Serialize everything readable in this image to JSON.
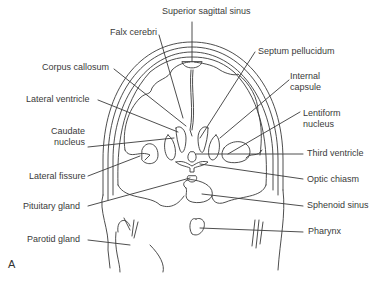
{
  "diagram": {
    "type": "anatomical coronal section of head",
    "figure_letter": "A",
    "labels_left": [
      {
        "id": "falx",
        "text": "Falx cerebri"
      },
      {
        "id": "corpus",
        "text": "Corpus callosum"
      },
      {
        "id": "latvent",
        "text": "Lateral ventricle"
      },
      {
        "id": "caudate",
        "text": "Caudate nucleus"
      },
      {
        "id": "latfiss",
        "text": "Lateral fissure"
      },
      {
        "id": "pituitary",
        "text": "Pituitary gland"
      },
      {
        "id": "parotid",
        "text": "Parotid gland"
      }
    ],
    "labels_right": [
      {
        "id": "sss",
        "text": "Superior sagittal sinus"
      },
      {
        "id": "septum",
        "text": "Septum pellucidum"
      },
      {
        "id": "intcap",
        "text": "Internal capsule"
      },
      {
        "id": "lentiform",
        "text": "Lentiform nucleus"
      },
      {
        "id": "third",
        "text": "Third ventricle"
      },
      {
        "id": "optic",
        "text": "Optic chiasm"
      },
      {
        "id": "sphenoid",
        "text": "Sphenoid sinus"
      },
      {
        "id": "pharynx",
        "text": "Pharynx"
      }
    ],
    "label_text": {
      "falx": "Falx cerebri",
      "corpus": "Corpus callosum",
      "latvent": "Lateral ventricle",
      "caudate_1": "Caudate",
      "caudate_2": "nucleus",
      "latfiss": "Lateral fissure",
      "pituitary": "Pituitary gland",
      "parotid": "Parotid gland",
      "sss": "Superior sagittal sinus",
      "septum": "Septum pellucidum",
      "intcap_1": "Internal",
      "intcap_2": "capsule",
      "lentiform_1": "Lentiform",
      "lentiform_2": "nucleus",
      "third": "Third ventricle",
      "optic": "Optic chiasm",
      "sphenoid": "Sphenoid sinus",
      "pharynx": "Pharynx"
    },
    "line_color": "#3a3a3a"
  }
}
